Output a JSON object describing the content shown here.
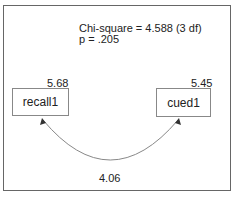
{
  "diagram": {
    "fit": {
      "chi_square_line": "Chi-square = 4.588 (3 df)",
      "p_line": "p = .205"
    },
    "nodes": [
      {
        "id": "recall1",
        "label": "recall1",
        "variance": "5.68"
      },
      {
        "id": "cued1",
        "label": "cued1",
        "variance": "5.45"
      }
    ],
    "edges": [
      {
        "from": "recall1",
        "to": "cued1",
        "type": "covariance",
        "label": "4.06"
      }
    ]
  }
}
